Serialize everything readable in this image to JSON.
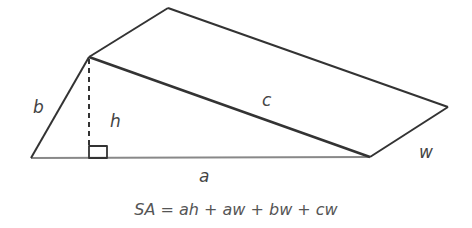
{
  "diagram": {
    "labels": {
      "a": "a",
      "b": "b",
      "c": "c",
      "h": "h",
      "w": "w"
    },
    "formula": "SA = ah + aw + bw + cw",
    "colors": {
      "stroke": "#333333",
      "text": "#555555"
    }
  }
}
